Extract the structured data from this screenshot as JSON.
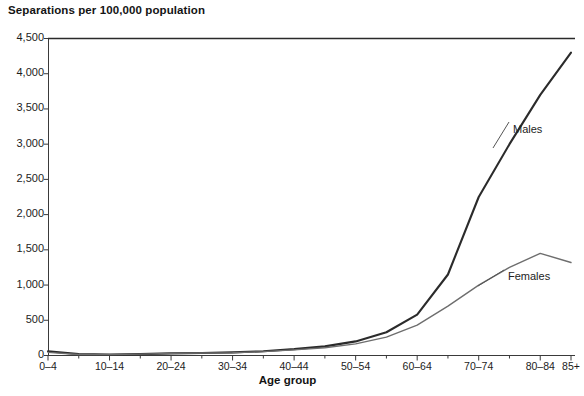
{
  "chart_data": {
    "type": "line",
    "title": "Separations per 100,000 population",
    "xlabel": "Age group",
    "ylabel": "Separations per 100,000 population",
    "ylim": [
      0,
      4500
    ],
    "yticks": [
      "0",
      "500",
      "1,000",
      "1,500",
      "2,000",
      "2,500",
      "3,000",
      "3,500",
      "4,000",
      "4,500"
    ],
    "ytick_values": [
      0,
      500,
      1000,
      1500,
      2000,
      2500,
      3000,
      3500,
      4000,
      4500
    ],
    "grid": false,
    "legend_position": "inline-right",
    "categories": [
      "0-4",
      "5-9",
      "10-14",
      "15-19",
      "20-24",
      "25-29",
      "30-34",
      "35-39",
      "40-44",
      "45-49",
      "50-54",
      "55-59",
      "60-64",
      "65-69",
      "70-74",
      "75-79",
      "80-84",
      "85+"
    ],
    "xtick_labels": [
      "0–4",
      "10–14",
      "20–24",
      "30–34",
      "40–44",
      "50–54",
      "60–64",
      "70–74",
      "80–84",
      "85+"
    ],
    "xtick_label_indices": [
      0,
      2,
      4,
      6,
      8,
      10,
      12,
      14,
      16,
      17
    ],
    "series": [
      {
        "name": "Males",
        "color": "#2b2b2b",
        "values": [
          60,
          20,
          15,
          20,
          30,
          35,
          45,
          60,
          90,
          130,
          200,
          330,
          580,
          1150,
          2250,
          3000,
          3700,
          4300
        ]
      },
      {
        "name": "Females",
        "color": "#6e6e6e",
        "values": [
          45,
          15,
          12,
          20,
          30,
          35,
          40,
          55,
          80,
          110,
          165,
          260,
          430,
          700,
          1000,
          1250,
          1450,
          1320
        ]
      }
    ],
    "annotations": [
      {
        "text": "Males",
        "series": "Males"
      },
      {
        "text": "Females",
        "series": "Females"
      }
    ]
  }
}
